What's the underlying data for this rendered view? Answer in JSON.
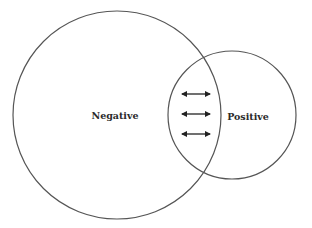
{
  "diagram": {
    "type": "overlapping-circles",
    "stroke_color": "#555555",
    "circles": [
      {
        "id": "negative",
        "label": "Negative",
        "cx": 117,
        "cy": 115,
        "r": 104
      },
      {
        "id": "positive",
        "label": "Positive",
        "cx": 232,
        "cy": 115,
        "r": 64
      }
    ],
    "arrows": [
      {
        "type": "double-headed",
        "y": 94,
        "x1": 181,
        "x2": 211
      },
      {
        "type": "double-headed",
        "y": 114,
        "x1": 181,
        "x2": 211
      },
      {
        "type": "double-headed",
        "y": 134,
        "x1": 181,
        "x2": 211
      }
    ]
  }
}
